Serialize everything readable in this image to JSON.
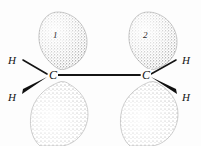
{
  "figure": {
    "background_color": "#fdfdfd",
    "ink_color": "#121212",
    "stipple_color": "#707070",
    "width": 201,
    "height": 146
  },
  "atoms": {
    "carbon_left": {
      "symbol": "C",
      "x": 52,
      "y": 75
    },
    "carbon_right": {
      "symbol": "C",
      "x": 145,
      "y": 75
    },
    "hydrogen_upper_left": {
      "symbol": "H",
      "x": 12,
      "y": 60,
      "bond_style": "plain-line"
    },
    "hydrogen_lower_left": {
      "symbol": "H",
      "x": 12,
      "y": 97,
      "bond_style": "bold-wedge"
    },
    "hydrogen_upper_right": {
      "symbol": "H",
      "x": 186,
      "y": 60,
      "bond_style": "plain-line"
    },
    "hydrogen_lower_right": {
      "symbol": "H",
      "x": 186,
      "y": 97,
      "bond_style": "bold-wedge"
    }
  },
  "bonds": {
    "carbon_carbon": {
      "type": "single-line",
      "from": "carbon_left",
      "to": "carbon_right"
    },
    "c_left_h_upper": {
      "type": "plain-line"
    },
    "c_left_h_lower": {
      "type": "bold-wedge"
    },
    "c_right_h_upper": {
      "type": "plain-line"
    },
    "c_right_h_lower": {
      "type": "bold-wedge"
    }
  },
  "orbitals": {
    "upper_left": {
      "label": "1",
      "position": "above-left",
      "shape": "teardrop-down"
    },
    "upper_right": {
      "label": "2",
      "position": "above-right",
      "shape": "teardrop-down"
    },
    "lower_left": {
      "label": "",
      "position": "below-left",
      "shape": "teardrop-up"
    },
    "lower_right": {
      "label": "",
      "position": "below-right",
      "shape": "teardrop-up"
    }
  }
}
